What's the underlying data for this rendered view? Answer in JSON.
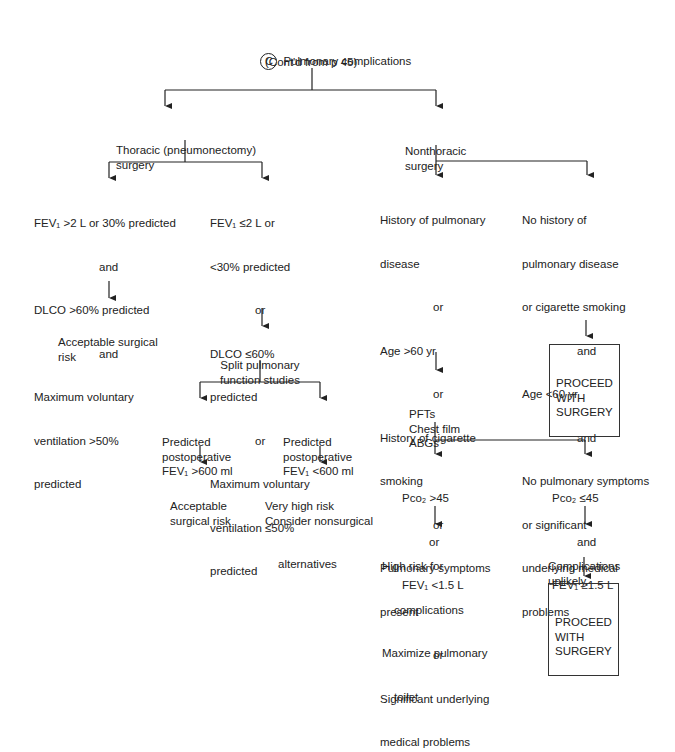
{
  "header": {
    "marker": "C",
    "title": "Pulmonary complications",
    "subtitle": "(Cont'd from p 45)"
  },
  "thoracic": {
    "label": [
      "Thoracic (pneumonectomy)",
      "surgery"
    ],
    "good": [
      "FEV₁ >2 L or 30% predicted",
      "and",
      "DLCO >60% predicted",
      "and",
      "Maximum voluntary",
      "ventilation >50%",
      "predicted"
    ],
    "good_outcome": [
      "Acceptable surgical",
      "risk"
    ],
    "poor": [
      "FEV₁ ≤2 L or",
      "<30% predicted",
      "or",
      "DLCO ≤60%",
      "predicted",
      "or",
      "Maximum voluntary",
      "ventilation ≤50%",
      "predicted"
    ],
    "split": [
      "Split pulmonary",
      "function studies"
    ],
    "post_high": [
      "Predicted",
      "postoperative",
      "FEV₁ >600 ml"
    ],
    "post_high_outcome": [
      "Acceptable",
      "surgical risk"
    ],
    "post_low": [
      "Predicted",
      "postoperative",
      "FEV₁ <600 ml"
    ],
    "post_low_outcome": [
      "Very high risk",
      "Consider nonsurgical",
      "alternatives"
    ]
  },
  "nonthoracic": {
    "label": [
      "Nonthoracic",
      "surgery"
    ],
    "risk": [
      "History of pulmonary",
      "disease",
      "or",
      "Age >60 yr",
      "or",
      "History of cigarette",
      "smoking",
      "or",
      "Pulmonary symptoms",
      "present",
      "or",
      "Significant underlying",
      "medical problems"
    ],
    "norisk": [
      "No history of",
      "pulmonary disease",
      "or cigarette smoking",
      "and",
      "Age <60 yr",
      "and",
      "No pulmonary symptoms",
      "or significant",
      "underlying medical",
      "problems"
    ],
    "proceed_box_1": [
      "PROCEED",
      "WITH",
      "SURGERY"
    ],
    "tests": [
      "PFTs",
      "Chest film",
      "ABGs"
    ],
    "abnormal": [
      "Pco₂ >45",
      "or",
      "FEV₁ <1.5 L"
    ],
    "abnormal_outcome": [
      "High risk for",
      "complications",
      "Maximize pulmonary",
      "toilet"
    ],
    "normal": [
      "Pco₂ ≤45",
      "and",
      "FEV₁ ≥1.5 L"
    ],
    "normal_outcome": [
      "Complications",
      "unlikely"
    ],
    "proceed_box_2": [
      "PROCEED",
      "WITH",
      "SURGERY"
    ]
  }
}
